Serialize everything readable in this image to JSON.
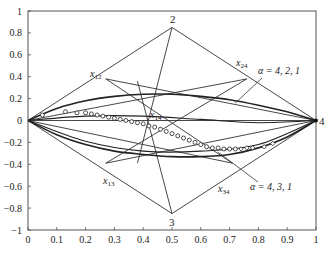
{
  "chart_data": {
    "type": "line",
    "title": "",
    "xlabel": "",
    "ylabel": "",
    "xlim": [
      0,
      1
    ],
    "ylim": [
      -1,
      1
    ],
    "grid": false,
    "x_ticks": [
      "0",
      "0.1",
      "0.2",
      "0.3",
      "0.4",
      "0.5",
      "0.6",
      "0.7",
      "0.8",
      "0.9",
      "1"
    ],
    "y_ticks": [
      "1",
      "0.8",
      "0.6",
      "0.4",
      "0.2",
      "0",
      "-0.2",
      "-0.4",
      "-0.6",
      "-0.8",
      "-1"
    ],
    "vertices": [
      {
        "label": "1",
        "x": 0.0,
        "y": 0.0,
        "show_label": false
      },
      {
        "label": "2",
        "x": 0.5,
        "y": 0.85
      },
      {
        "label": "3",
        "x": 0.5,
        "y": -0.85
      },
      {
        "label": "4",
        "x": 1.0,
        "y": 0.0
      }
    ],
    "intermediate_points": [
      {
        "label": "x12",
        "x": 0.27,
        "y": 0.38
      },
      {
        "label": "x24",
        "x": 0.76,
        "y": 0.38
      },
      {
        "label": "x13",
        "x": 0.27,
        "y": -0.39
      },
      {
        "label": "x34",
        "x": 0.71,
        "y": -0.39
      },
      {
        "label": "x14",
        "x": 0.44,
        "y": 0.26
      }
    ],
    "lines": [
      [
        [
          0,
          0
        ],
        [
          0.5,
          0.85
        ]
      ],
      [
        [
          0.5,
          0.85
        ],
        [
          1,
          0
        ]
      ],
      [
        [
          0,
          0
        ],
        [
          0.5,
          -0.85
        ]
      ],
      [
        [
          0.5,
          -0.85
        ],
        [
          1,
          0
        ]
      ],
      [
        [
          0.27,
          0.38
        ],
        [
          1,
          0
        ]
      ],
      [
        [
          0,
          0
        ],
        [
          0.76,
          0.38
        ]
      ],
      [
        [
          0.27,
          0.38
        ],
        [
          0.71,
          -0.39
        ]
      ],
      [
        [
          0.76,
          0.38
        ],
        [
          0.27,
          -0.39
        ]
      ],
      [
        [
          0.27,
          -0.39
        ],
        [
          1,
          0
        ]
      ],
      [
        [
          0,
          0
        ],
        [
          0.71,
          -0.39
        ]
      ],
      [
        [
          0.5,
          0.85
        ],
        [
          0.38,
          -0.39
        ]
      ],
      [
        [
          0.5,
          -0.85
        ],
        [
          0.38,
          0.36
        ]
      ],
      [
        [
          0,
          0
        ],
        [
          1,
          0
        ]
      ]
    ],
    "series": [
      {
        "name": "α = 4, 2, 1",
        "type": "curve",
        "x": [
          0,
          0.1,
          0.2,
          0.3,
          0.4,
          0.5,
          0.6,
          0.7,
          0.8,
          0.9,
          1.0
        ],
        "y": [
          0,
          0.11,
          0.18,
          0.22,
          0.24,
          0.24,
          0.22,
          0.19,
          0.14,
          0.08,
          0
        ]
      },
      {
        "name": "α = 4, 3, 1",
        "type": "curve",
        "x": [
          0,
          0.1,
          0.2,
          0.3,
          0.4,
          0.5,
          0.6,
          0.7,
          0.8,
          0.9,
          1.0
        ],
        "y": [
          0,
          -0.13,
          -0.22,
          -0.28,
          -0.31,
          -0.33,
          -0.33,
          -0.31,
          -0.25,
          -0.15,
          0
        ]
      },
      {
        "name": "upper-secondary curve",
        "type": "curve",
        "x": [
          0,
          0.2,
          0.4,
          0.6,
          0.8,
          1.0
        ],
        "y": [
          0,
          0.04,
          0.04,
          0.01,
          -0.02,
          0
        ]
      },
      {
        "name": "lower-secondary curve",
        "type": "curve",
        "x": [
          0,
          0.2,
          0.4,
          0.6,
          0.8,
          1.0
        ],
        "y": [
          0,
          -0.19,
          -0.28,
          -0.28,
          -0.22,
          0
        ]
      },
      {
        "name": "data points (markers)",
        "type": "scatter",
        "marker": "circle/diamond",
        "x": [
          0.05,
          0.13,
          0.17,
          0.2,
          0.22,
          0.24,
          0.26,
          0.28,
          0.3,
          0.32,
          0.34,
          0.36,
          0.38,
          0.4,
          0.42,
          0.44,
          0.46,
          0.48,
          0.5,
          0.52,
          0.54,
          0.56,
          0.58,
          0.6,
          0.62,
          0.64,
          0.66,
          0.68,
          0.7,
          0.72,
          0.74,
          0.76,
          0.78,
          0.82,
          0.85
        ],
        "y": [
          0.05,
          0.08,
          0.07,
          0.07,
          0.06,
          0.05,
          0.04,
          0.03,
          0.02,
          0.01,
          0.0,
          -0.01,
          -0.02,
          -0.03,
          -0.05,
          -0.06,
          -0.08,
          -0.1,
          -0.12,
          -0.14,
          -0.16,
          -0.18,
          -0.2,
          -0.22,
          -0.24,
          -0.25,
          -0.25,
          -0.26,
          -0.26,
          -0.26,
          -0.26,
          -0.25,
          -0.25,
          -0.24,
          -0.21
        ]
      }
    ],
    "annotations": [
      {
        "text": "α = 4, 2, 1",
        "x": 0.8,
        "y": 0.38,
        "pointer_to": [
          0.72,
          0.16
        ]
      },
      {
        "text": "α = 4, 3, 1",
        "x": 0.8,
        "y": -0.62,
        "pointer_to": [
          0.66,
          -0.29
        ]
      }
    ]
  },
  "labels": {
    "v2": "2",
    "v3": "3",
    "v4": "4",
    "x12_main": "x",
    "x12_sub": "12",
    "x24_main": "x",
    "x24_sub": "24",
    "x13_main": "x",
    "x13_sub": "13",
    "x34_main": "x",
    "x34_sub": "34",
    "x14_main": "x",
    "x14_sub": "14",
    "alpha421": "α = 4, 2, 1",
    "alpha431": "α = 4, 3, 1"
  }
}
